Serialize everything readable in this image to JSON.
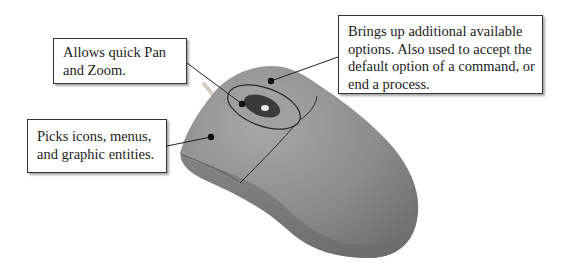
{
  "diagram": {
    "callouts": [
      {
        "id": "wheel",
        "lines": [
          "Allows quick Pan",
          "and Zoom."
        ]
      },
      {
        "id": "left-button",
        "lines": [
          "Picks icons, menus,",
          "and graphic entities."
        ]
      },
      {
        "id": "right-button",
        "lines": [
          "Brings up additional available",
          "options. Also used to accept the",
          "default option of a command, or",
          "end a process."
        ]
      }
    ],
    "colors": {
      "mouse_body": "#8a8a8a",
      "mouse_light": "#a6a6a6",
      "mouse_dark": "#6e6e6e",
      "outline": "#2a2a2a",
      "text": "#1c1c1c",
      "background": "#ffffff"
    }
  }
}
